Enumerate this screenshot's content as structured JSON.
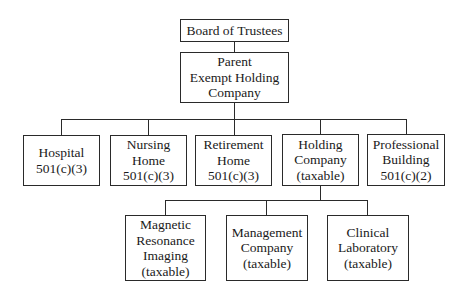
{
  "diagram": {
    "type": "org-chart",
    "title": "",
    "nodes": {
      "board": {
        "label": "Board of Trustees"
      },
      "parent": {
        "label": "Parent\nExempt Holding\nCompany"
      },
      "hospital": {
        "label": "Hospital\n501(c)(3)"
      },
      "nursing_home": {
        "label": "Nursing\nHome\n501(c)(3)"
      },
      "retirement_home": {
        "label": "Retirement\nHome\n501(c)(3)"
      },
      "holding_company": {
        "label": "Holding\nCompany\n(taxable)"
      },
      "professional_building": {
        "label": "Professional\nBuilding\n501(c)(2)"
      },
      "mri": {
        "label": "Magnetic\nResonance\nImaging\n(taxable)"
      },
      "management_company": {
        "label": "Management\nCompany\n(taxable)"
      },
      "clinical_laboratory": {
        "label": "Clinical\nLaboratory\n(taxable)"
      }
    },
    "edges": [
      [
        "board",
        "parent"
      ],
      [
        "parent",
        "hospital"
      ],
      [
        "parent",
        "nursing_home"
      ],
      [
        "parent",
        "retirement_home"
      ],
      [
        "parent",
        "holding_company"
      ],
      [
        "parent",
        "professional_building"
      ],
      [
        "holding_company",
        "mri"
      ],
      [
        "holding_company",
        "management_company"
      ],
      [
        "holding_company",
        "clinical_laboratory"
      ]
    ]
  }
}
